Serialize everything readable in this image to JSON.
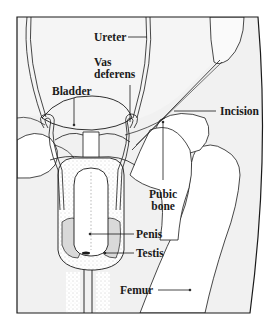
{
  "diagram": {
    "type": "anatomical-illustration",
    "colors": {
      "ink": "#1a1a1a",
      "background": "#ffffff",
      "tissue_shade": "#eeeeee",
      "scrotum_shade": "#d9d9d9"
    },
    "labels": {
      "ureter": "Ureter",
      "vas_deferens_line1": "Vas",
      "vas_deferens_line2": "deferens",
      "bladder": "Bladder",
      "incision": "Incision",
      "pubic_bone_line1": "Pubic",
      "pubic_bone_line2": "bone",
      "penis": "Penis",
      "testis": "Testis",
      "femur": "Femur"
    }
  }
}
